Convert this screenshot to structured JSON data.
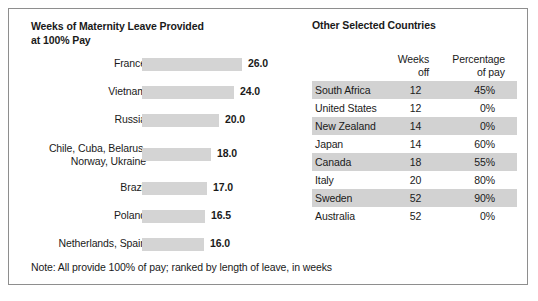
{
  "figure": {
    "note": "Note: All provide 100% of pay; ranked by length of leave, in weeks",
    "bar_color": "#d4d4d4",
    "row_shade_color": "#d2d2d2",
    "border_color": "#8e8e8e"
  },
  "bar_panel": {
    "title_line1": "Weeks of Maternity Leave Provided",
    "title_line2": "at 100% Pay"
  },
  "table_panel": {
    "title": "Other Selected Countries",
    "columns": {
      "country": "",
      "weeks_line1": "Weeks",
      "weeks_line2": "off",
      "pct_line1": "Percentage",
      "pct_line2": "of pay"
    },
    "rows": [
      {
        "country": "South Africa",
        "weeks": "12",
        "pct": "45%",
        "shaded": true
      },
      {
        "country": "United States",
        "weeks": "12",
        "pct": "0%",
        "shaded": false
      },
      {
        "country": "New Zealand",
        "weeks": "14",
        "pct": "0%",
        "shaded": true
      },
      {
        "country": "Japan",
        "weeks": "14",
        "pct": "60%",
        "shaded": false
      },
      {
        "country": "Canada",
        "weeks": "18",
        "pct": "55%",
        "shaded": true
      },
      {
        "country": "Italy",
        "weeks": "20",
        "pct": "80%",
        "shaded": false
      },
      {
        "country": "Sweden",
        "weeks": "52",
        "pct": "90%",
        "shaded": true
      },
      {
        "country": "Australia",
        "weeks": "52",
        "pct": "0%",
        "shaded": false
      }
    ]
  },
  "chart_data": {
    "type": "bar",
    "title": "Weeks of Maternity Leave Provided at 100% Pay",
    "orientation": "horizontal",
    "xlabel": "",
    "ylabel": "",
    "xlim": [
      0,
      26
    ],
    "grid": false,
    "legend": null,
    "note": "Note: All provide 100% of pay; ranked by length of leave, in weeks",
    "categories": [
      "France",
      "Vietnam",
      "Russia",
      "Chile, Cuba, Belarus,\nNorway, Ukraine",
      "Brazil",
      "Poland",
      "Netherlands, Spain"
    ],
    "values": [
      26.0,
      24.0,
      20.0,
      18.0,
      17.0,
      16.5,
      16.0
    ],
    "value_labels": [
      "26.0",
      "24.0",
      "20.0",
      "18.0",
      "17.0",
      "16.5",
      "16.0"
    ],
    "bars": [
      {
        "label": "France",
        "value": 26.0,
        "display": "26.0",
        "width_px": 100,
        "two_line": false
      },
      {
        "label": "Vietnam",
        "value": 24.0,
        "display": "24.0",
        "width_px": 92,
        "two_line": false
      },
      {
        "label": "Russia",
        "value": 20.0,
        "display": "20.0",
        "width_px": 77,
        "two_line": false
      },
      {
        "label": "Chile, Cuba, Belarus,\nNorway, Ukraine",
        "value": 18.0,
        "display": "18.0",
        "width_px": 69,
        "two_line": true
      },
      {
        "label": "Brazil",
        "value": 17.0,
        "display": "17.0",
        "width_px": 65,
        "two_line": false
      },
      {
        "label": "Poland",
        "value": 16.5,
        "display": "16.5",
        "width_px": 63,
        "two_line": false
      },
      {
        "label": "Netherlands, Spain",
        "value": 16.0,
        "display": "16.0",
        "width_px": 62,
        "two_line": false
      }
    ],
    "secondary_table": {
      "type": "table",
      "title": "Other Selected Countries",
      "columns": [
        "",
        "Weeks off",
        "Percentage of pay"
      ],
      "rows": [
        [
          "South Africa",
          12,
          "45%"
        ],
        [
          "United States",
          12,
          "0%"
        ],
        [
          "New Zealand",
          14,
          "0%"
        ],
        [
          "Japan",
          14,
          "60%"
        ],
        [
          "Canada",
          18,
          "55%"
        ],
        [
          "Italy",
          20,
          "80%"
        ],
        [
          "Sweden",
          52,
          "90%"
        ],
        [
          "Australia",
          52,
          "0%"
        ]
      ]
    }
  }
}
